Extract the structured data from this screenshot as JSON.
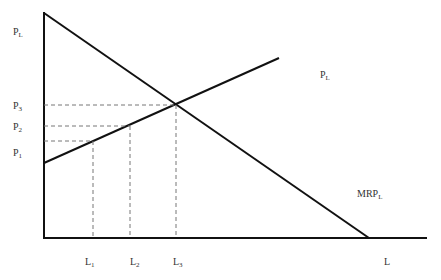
{
  "diagram": {
    "type": "labor market: marginal resource product vs labor supply",
    "axes": {
      "y_label": {
        "main": "P",
        "sub": "L"
      },
      "x_label": {
        "main": "L",
        "sub": ""
      }
    },
    "curves": [
      {
        "name": "MRP",
        "label": {
          "main": "MRP",
          "sub": "L"
        },
        "direction": "downward"
      },
      {
        "name": "supply",
        "label": {
          "main": "P",
          "sub": "L"
        },
        "direction": "upward"
      }
    ],
    "price_levels": [
      {
        "main": "P",
        "sub": "3"
      },
      {
        "main": "P",
        "sub": "2"
      },
      {
        "main": "P",
        "sub": "1"
      }
    ],
    "quantity_levels": [
      {
        "main": "L",
        "sub": "1"
      },
      {
        "main": "L",
        "sub": "2"
      },
      {
        "main": "L",
        "sub": "3"
      }
    ],
    "colors": {
      "line": "#111111",
      "dash": "#777777"
    }
  }
}
